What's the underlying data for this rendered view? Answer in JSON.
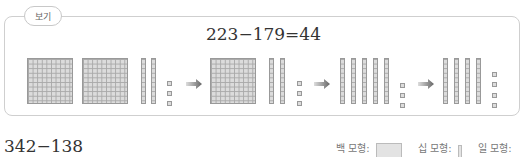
{
  "example_box": {
    "tag_label": "보기",
    "equation": "223−179=44"
  },
  "panels": [
    {
      "hundreds": 2,
      "tens": 2,
      "ones": 3
    },
    {
      "hundreds": 1,
      "tens": 2,
      "ones": 3
    },
    {
      "hundreds": 0,
      "tens": 5,
      "ones": 3
    },
    {
      "hundreds": 0,
      "tens": 4,
      "ones": 4
    }
  ],
  "problem": {
    "expression": "342−138"
  },
  "legend": {
    "hundred_label": "백 모형:",
    "ten_label": "십 모형:",
    "one_label": "일 모형:"
  },
  "colors": {
    "border": "#cfcfcf",
    "block_fill": "#dcdcdc",
    "block_grid": "#a9a9a9",
    "arrow": "#777777",
    "text": "#333333"
  }
}
